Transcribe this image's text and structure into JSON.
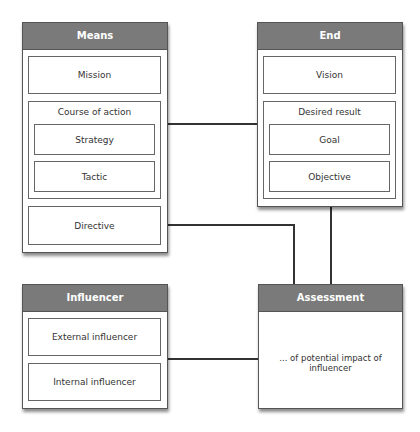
{
  "means": {
    "title": "Means",
    "mission": "Mission",
    "course_of_action": {
      "title": "Course of action",
      "strategy": "Strategy",
      "tactic": "Tactic"
    },
    "directive": "Directive"
  },
  "end": {
    "title": "End",
    "vision": "Vision",
    "desired_result": {
      "title": "Desired result",
      "goal": "Goal",
      "objective": "Objective"
    }
  },
  "influencer": {
    "title": "Influencer",
    "external": "External influencer",
    "internal": "Internal influencer"
  },
  "assessment": {
    "title": "Assessment",
    "description": "... of potential impact of influencer"
  },
  "colors": {
    "header": "#7a7a7a",
    "border": "#555555",
    "line": "#333333"
  }
}
